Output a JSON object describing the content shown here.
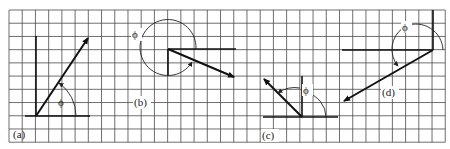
{
  "figure": {
    "grid": {
      "x0": 9,
      "y0": 10,
      "cell": 13.22,
      "cols": 33,
      "rows": 10,
      "color": "#4a4a4a"
    },
    "panels": [
      {
        "id": "a",
        "label": "(a)",
        "angle_label": "ϕ",
        "origin": [
          36,
          116
        ],
        "tip": [
          88,
          37
        ],
        "axis_h": [
          25,
          90
        ],
        "axis_v": [
          36,
          116
        ],
        "arc_radius": 40,
        "label_pos": [
          14,
          137
        ],
        "angle_label_pos": [
          58,
          106
        ]
      },
      {
        "id": "b",
        "label": "(b)",
        "angle_label": "ϕ",
        "origin": [
          168,
          49
        ],
        "tip": [
          235,
          77
        ],
        "axis_h": [
          168,
          236
        ],
        "axis_v": [
          49,
          76
        ],
        "arc_radius": 28,
        "label_pos": [
          134,
          106
        ],
        "angle_label_pos": [
          137,
          38
        ]
      },
      {
        "id": "c",
        "label": "(c)",
        "angle_label": "ϕ",
        "origin": [
          302,
          117
        ],
        "tip": [
          263,
          78
        ],
        "axis_h": [
          263,
          338
        ],
        "axis_v": [
          76,
          117
        ],
        "arc_radius": 29,
        "label_pos": [
          262,
          139
        ],
        "angle_label_pos": [
          306,
          94
        ]
      },
      {
        "id": "d",
        "label": "(d)",
        "angle_label": "ϕ",
        "origin": [
          433,
          50
        ],
        "tip": [
          343,
          102
        ],
        "axis_h": [
          342,
          433
        ],
        "axis_v": [
          10,
          50
        ],
        "arc_radius": 27,
        "label_pos": [
          382,
          96
        ],
        "angle_label_pos": [
          404,
          31
        ]
      }
    ]
  }
}
